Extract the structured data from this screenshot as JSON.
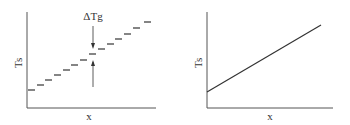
{
  "colors": {
    "ink": "#333333",
    "axis": "#555555",
    "background": "#ffffff"
  },
  "left_panel": {
    "ylabel": "Ts",
    "xlabel": "x",
    "annotation": "ΔTg",
    "steps": [
      {
        "x": 27,
        "y": 90
      },
      {
        "x": 36,
        "y": 85
      },
      {
        "x": 44,
        "y": 80
      },
      {
        "x": 53,
        "y": 75
      },
      {
        "x": 62,
        "y": 70
      },
      {
        "x": 70,
        "y": 65
      },
      {
        "x": 79,
        "y": 60
      },
      {
        "x": 88,
        "y": 54
      },
      {
        "x": 97,
        "y": 49
      },
      {
        "x": 106,
        "y": 44
      },
      {
        "x": 114,
        "y": 39
      },
      {
        "x": 123,
        "y": 34
      },
      {
        "x": 132,
        "y": 28
      },
      {
        "x": 143,
        "y": 22
      }
    ]
  },
  "right_panel": {
    "ylabel": "Ts",
    "xlabel": "x",
    "line": {
      "x1": 207,
      "y1": 92,
      "x2": 321,
      "y2": 25
    }
  }
}
